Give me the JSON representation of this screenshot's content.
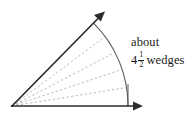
{
  "figure": {
    "name": "angle-measured-in-wedges",
    "background_color": "#ffffff",
    "width": 195,
    "height": 118
  },
  "annotation": {
    "line1": "about",
    "whole": "4",
    "numerator": "1",
    "denominator": "2",
    "unit": "wedges",
    "full_text": "about 4 1/2 wedges",
    "color": "#1a1a1a"
  },
  "diagram": {
    "vertex": {
      "x": 12,
      "y": 106
    },
    "rays": [
      {
        "name": "horizontal-ray",
        "from": {
          "x": 12,
          "y": 106
        },
        "to": {
          "x": 142,
          "y": 106
        },
        "has_arrowhead": true,
        "color": "#2b2b2b",
        "stroke_width": 1.4
      },
      {
        "name": "upper-ray",
        "from": {
          "x": 12,
          "y": 106
        },
        "to": {
          "x": 104,
          "y": 12
        },
        "has_arrowhead": true,
        "color": "#2b2b2b",
        "stroke_width": 1.6,
        "angle_degrees": 45.6
      }
    ],
    "arc": {
      "name": "angle-arc",
      "center": {
        "x": 12,
        "y": 106
      },
      "radius": 116,
      "start_angle_degrees": 45.6,
      "end_angle_degrees": 0,
      "color": "#555555",
      "stroke_width": 1.1
    },
    "wedge_divider_count": 4,
    "wedge_dividers": [
      {
        "name": "wedge-divider-1",
        "angle_degrees": 9.1,
        "color": "#b8b8b8"
      },
      {
        "name": "wedge-divider-2",
        "angle_degrees": 18.2,
        "color": "#b8b8b8"
      },
      {
        "name": "wedge-divider-3",
        "angle_degrees": 27.4,
        "color": "#b8b8b8"
      },
      {
        "name": "wedge-divider-4",
        "angle_degrees": 36.5,
        "color": "#b8b8b8"
      }
    ],
    "dash_pattern": "2.2 2.4",
    "total_wedges": 4.5,
    "arc_end_tick": {
      "name": "arc-end-tick",
      "from": {
        "x": 128,
        "y": 106
      },
      "to": {
        "x": 128,
        "y": 82
      },
      "color": "#555555"
    }
  }
}
